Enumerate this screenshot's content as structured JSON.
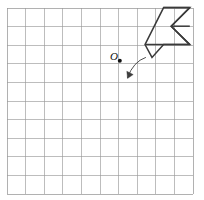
{
  "figure": {
    "canvas": {
      "width": 204,
      "height": 200,
      "background": "#ffffff"
    },
    "grid": {
      "name": "square-grid",
      "x0": 7,
      "y0": 8,
      "cols": 10,
      "rows": 10,
      "cell": 18.6,
      "line_color": "#9a9a9a",
      "line_width": 0.9,
      "border_color": "#9a9a9a"
    },
    "point": {
      "label": "O",
      "label_x": 110,
      "label_y": 51,
      "dot_x": 119.8,
      "dot_y": 60.8,
      "dot_r": 2.0,
      "color": "#111111"
    },
    "arrow": {
      "name": "curved-rotation-arrow",
      "path": "M 145.5 57.5 Q 133.5 61.5 127.5 77.5",
      "head": "M 127.5 78.5 L 126.8 71.2 L 133.2 74.6 Z",
      "color": "#3c3c3c",
      "width": 0.9
    },
    "polygon": {
      "name": "arrow-polygon",
      "outline": "M 145.0 44.6 L 163.6 7.6 L 189.8 7.6 L 171.2 26.2 L 189.8 44.6 L 163.6 44.6 L 152.0 57.4 Z",
      "chevron": "M 189.8 7.6 L 171.2 26.2 L 189.8 44.6",
      "color": "#3a3a3a",
      "width": 1.5,
      "fill": "none"
    },
    "extra_segments": [
      {
        "name": "top-edge",
        "d": "M 163.6 7.6 L 189.8 7.6"
      },
      {
        "name": "mid-right-edge",
        "d": "M 171.2 26.2 L 189.8 26.2"
      },
      {
        "name": "lower-horizontal",
        "d": "M 145.0 44.6 L 189.8 44.6"
      }
    ]
  }
}
